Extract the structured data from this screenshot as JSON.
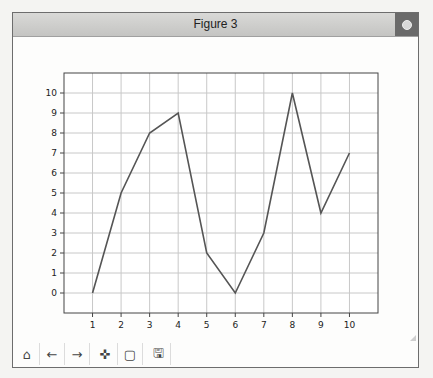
{
  "background": {
    "bleed_text": "Adding grid"
  },
  "window": {
    "title": "Figure 3",
    "close_icon": "power-icon"
  },
  "toolbar": {
    "buttons": [
      {
        "name": "home",
        "icon": "home-icon",
        "glyph": "⌂"
      },
      {
        "name": "back",
        "icon": "arrow-left-icon",
        "glyph": "←"
      },
      {
        "name": "forward",
        "icon": "arrow-right-icon",
        "glyph": "→"
      },
      {
        "name": "pan",
        "icon": "move-icon",
        "glyph": "✜"
      },
      {
        "name": "zoom",
        "icon": "zoom-rect-icon",
        "glyph": "▢"
      },
      {
        "name": "save",
        "icon": "save-icon",
        "glyph": "🖫"
      }
    ]
  },
  "chart_data": {
    "type": "line",
    "title": "",
    "xlabel": "",
    "ylabel": "",
    "x": [
      1,
      2,
      3,
      4,
      5,
      6,
      7,
      8,
      9,
      10
    ],
    "series": [
      {
        "name": "",
        "values": [
          0,
          5,
          8,
          9,
          2,
          0,
          3,
          10,
          4,
          7
        ],
        "color": "#555555"
      }
    ],
    "xticks": [
      1,
      2,
      3,
      4,
      5,
      6,
      7,
      8,
      9,
      10
    ],
    "yticks": [
      0,
      1,
      2,
      3,
      4,
      5,
      6,
      7,
      8,
      9,
      10
    ],
    "xlim": [
      0,
      11
    ],
    "ylim": [
      -1,
      11
    ],
    "grid": true,
    "legend": null
  }
}
